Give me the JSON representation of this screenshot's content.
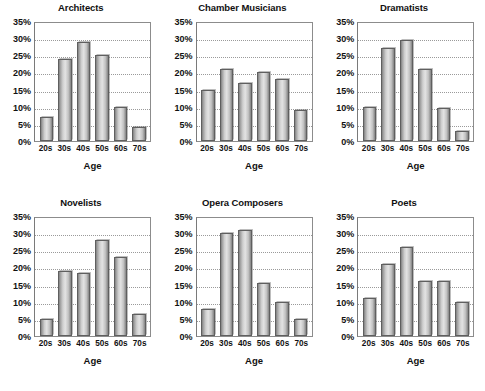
{
  "figure": {
    "shared_x_axis_title": "Age",
    "shared_y_ticks": [
      "0%",
      "5%",
      "10%",
      "15%",
      "20%",
      "25%",
      "30%",
      "35%"
    ],
    "shared_categories": [
      "20s",
      "30s",
      "40s",
      "50s",
      "60s",
      "70s"
    ],
    "bar_fill_light": "#e3e3e3",
    "bar_fill_dark": "#7e7e7e",
    "bar_border": "#5f5f5f",
    "gridline_color": "#9a9a9a",
    "axis_color": "#8c8c8c",
    "text_color": "#111111",
    "background": "#ffffff"
  },
  "chart_data": [
    {
      "type": "bar",
      "title": "Architects",
      "xlabel": "Age",
      "ylabel": "",
      "categories": [
        "20s",
        "30s",
        "40s",
        "50s",
        "60s",
        "70s"
      ],
      "values": [
        7,
        24,
        29,
        25,
        10,
        4
      ],
      "ylim": [
        0,
        35
      ],
      "ytick_values": [
        0,
        5,
        10,
        15,
        20,
        25,
        30,
        35
      ],
      "ytick_labels": [
        "0%",
        "5%",
        "10%",
        "15%",
        "20%",
        "25%",
        "30%",
        "35%"
      ],
      "grid": true,
      "legend": "none"
    },
    {
      "type": "bar",
      "title": "Chamber Musicians",
      "xlabel": "Age",
      "ylabel": "",
      "categories": [
        "20s",
        "30s",
        "40s",
        "50s",
        "60s",
        "70s"
      ],
      "values": [
        15,
        21,
        17,
        20,
        18,
        9
      ],
      "ylim": [
        0,
        35
      ],
      "ytick_values": [
        0,
        5,
        10,
        15,
        20,
        25,
        30,
        35
      ],
      "ytick_labels": [
        "0%",
        "5%",
        "10%",
        "15%",
        "20%",
        "25%",
        "30%",
        "35%"
      ],
      "grid": true,
      "legend": "none"
    },
    {
      "type": "bar",
      "title": "Dramatists",
      "xlabel": "Age",
      "ylabel": "",
      "categories": [
        "20s",
        "30s",
        "40s",
        "50s",
        "60s",
        "70s"
      ],
      "values": [
        10,
        27,
        29.5,
        21,
        9.5,
        3
      ],
      "ylim": [
        0,
        35
      ],
      "ytick_values": [
        0,
        5,
        10,
        15,
        20,
        25,
        30,
        35
      ],
      "ytick_labels": [
        "0%",
        "5%",
        "10%",
        "15%",
        "20%",
        "25%",
        "30%",
        "35%"
      ],
      "grid": true,
      "legend": "none"
    },
    {
      "type": "bar",
      "title": "Novelists",
      "xlabel": "Age",
      "ylabel": "",
      "categories": [
        "20s",
        "30s",
        "40s",
        "50s",
        "60s",
        "70s"
      ],
      "values": [
        5,
        19,
        18.5,
        28,
        23,
        6.5
      ],
      "ylim": [
        0,
        35
      ],
      "ytick_values": [
        0,
        5,
        10,
        15,
        20,
        25,
        30,
        35
      ],
      "ytick_labels": [
        "0%",
        "5%",
        "10%",
        "15%",
        "20%",
        "25%",
        "30%",
        "35%"
      ],
      "grid": true,
      "legend": "none"
    },
    {
      "type": "bar",
      "title": "Opera Composers",
      "xlabel": "Age",
      "ylabel": "",
      "categories": [
        "20s",
        "30s",
        "40s",
        "50s",
        "60s",
        "70s"
      ],
      "values": [
        8,
        30,
        31,
        15.5,
        10,
        5
      ],
      "ylim": [
        0,
        35
      ],
      "ytick_values": [
        0,
        5,
        10,
        15,
        20,
        25,
        30,
        35
      ],
      "ytick_labels": [
        "0%",
        "5%",
        "10%",
        "15%",
        "20%",
        "25%",
        "30%",
        "35%"
      ],
      "grid": true,
      "legend": "none"
    },
    {
      "type": "bar",
      "title": "Poets",
      "xlabel": "Age",
      "ylabel": "",
      "categories": [
        "20s",
        "30s",
        "40s",
        "50s",
        "60s",
        "70s"
      ],
      "values": [
        11,
        21,
        26,
        16,
        16,
        10
      ],
      "ylim": [
        0,
        35
      ],
      "ytick_values": [
        0,
        5,
        10,
        15,
        20,
        25,
        30,
        35
      ],
      "ytick_labels": [
        "0%",
        "5%",
        "10%",
        "15%",
        "20%",
        "25%",
        "30%",
        "35%"
      ],
      "grid": true,
      "legend": "none"
    }
  ]
}
